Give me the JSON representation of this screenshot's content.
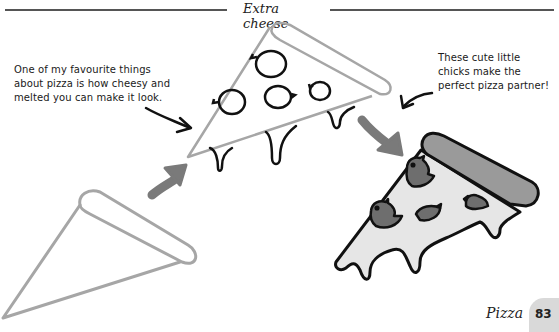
{
  "header": {
    "title": "Extra cheese"
  },
  "notes": {
    "left": {
      "lines": [
        "One of my favourite things",
        "about pizza is how cheesy and",
        "melted you can make it look."
      ]
    },
    "right": {
      "lines": [
        "These cute little",
        "chicks make the",
        "perfect pizza partner!"
      ]
    }
  },
  "illustrations": {
    "step1": "pizza-slice-outline",
    "step2": "pizza-slice-with-cheese-drips-and-pepperoni",
    "step3": "pizza-slice-colored-with-chick-toppings",
    "arrows": [
      "arrow-step1-to-step2",
      "arrow-step2-to-step3"
    ],
    "colors": {
      "outline_light": "#a6a6a6",
      "outline_dark": "#111111",
      "crust_fill": "#9a9a9a",
      "cheese_fill": "#e6e6e6",
      "chick_fill": "#6e6e6e",
      "arrow_fill": "#7a7a7a"
    }
  },
  "footer": {
    "section_label": "Pizza",
    "page_number": "83",
    "badge_color": "#d9d9d9"
  }
}
